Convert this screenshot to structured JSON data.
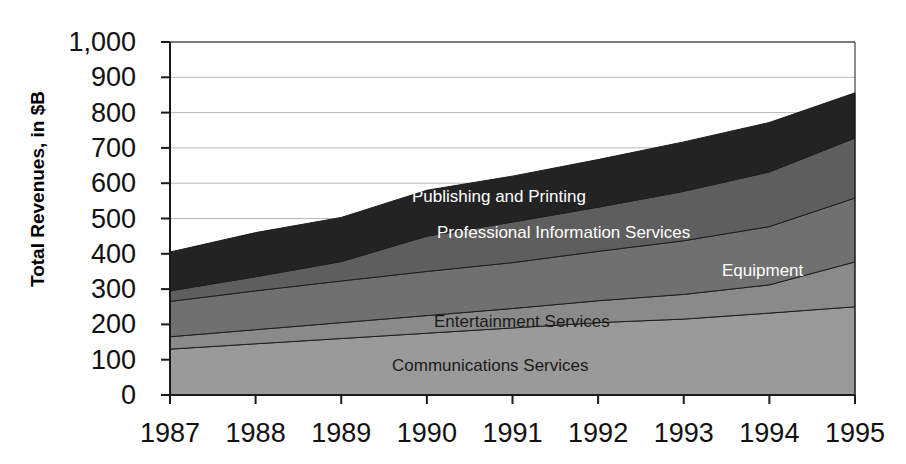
{
  "chart_data": {
    "type": "area",
    "title": "",
    "xlabel": "",
    "ylabel": "Total Revenues, in $B",
    "categories": [
      "1987",
      "1988",
      "1989",
      "1990",
      "1991",
      "1992",
      "1993",
      "1994",
      "1995"
    ],
    "x": [
      1987,
      1988,
      1989,
      1990,
      1991,
      1992,
      1993,
      1994,
      1995
    ],
    "ylim": [
      0,
      1000
    ],
    "ytick_labels": [
      "1,000",
      "900",
      "800",
      "700",
      "600",
      "500",
      "400",
      "300",
      "200",
      "100",
      "0"
    ],
    "ytick_values": [
      1000,
      900,
      800,
      700,
      600,
      500,
      400,
      300,
      200,
      100,
      0
    ],
    "grid": true,
    "stacked": true,
    "legend": "inline-labels",
    "series": [
      {
        "name": "Communications Services",
        "color": "#9a9a9a",
        "values": [
          130,
          145,
          160,
          175,
          190,
          205,
          215,
          232,
          250
        ]
      },
      {
        "name": "Entertainment Services",
        "color": "#8a8a8a",
        "values": [
          35,
          40,
          45,
          50,
          55,
          62,
          70,
          80,
          127
        ]
      },
      {
        "name": "Equipment",
        "color": "#707070",
        "values": [
          100,
          110,
          118,
          125,
          130,
          140,
          152,
          165,
          181
        ]
      },
      {
        "name": "Professional Information Services",
        "color": "#5e5e5e",
        "values": [
          30,
          40,
          55,
          100,
          115,
          125,
          140,
          155,
          170
        ]
      },
      {
        "name": "Publishing and Printing",
        "color": "#232323",
        "values": [
          110,
          125,
          125,
          130,
          130,
          135,
          140,
          140,
          128
        ]
      }
    ],
    "totals": [
      405,
      460,
      503,
      580,
      620,
      667,
      717,
      772,
      856
    ],
    "series_label_style": {
      "Publishing and Printing": "light",
      "Professional Information Services": "light",
      "Equipment": "light",
      "Entertainment Services": "dark",
      "Communications Services": "dark"
    }
  },
  "axis": {
    "y_title": "Total Revenues, in $B"
  }
}
